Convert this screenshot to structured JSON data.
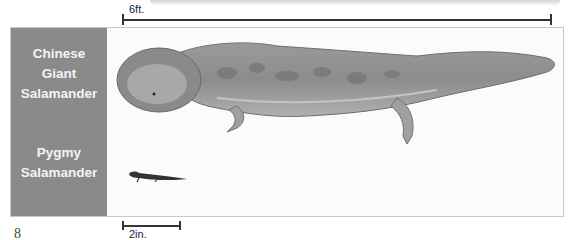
{
  "scale_bars": {
    "large": {
      "label": "6ft."
    },
    "small": {
      "label": "2in."
    }
  },
  "species": [
    {
      "name_line1": "Chinese",
      "name_line2": "Giant",
      "name_line3": "Salamander"
    },
    {
      "name_line1": "Pygmy",
      "name_line2": "Salamander"
    }
  ],
  "page_mark": "8",
  "colors": {
    "label_panel": "#8a8a8a",
    "label_text": "#f4f4f4",
    "background": "#fbfbfb"
  }
}
